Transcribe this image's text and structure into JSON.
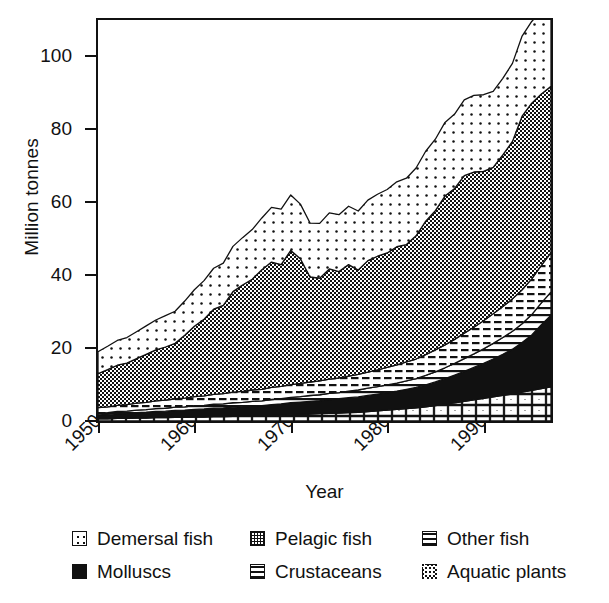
{
  "axes": {
    "ylabel": "Million tonnes",
    "xlabel": "Year",
    "yticks": [
      "0",
      "20",
      "40",
      "60",
      "80",
      "100"
    ],
    "xticks": [
      "1950",
      "1960",
      "1970",
      "1980",
      "1990"
    ]
  },
  "legend": {
    "items": [
      {
        "label": "Demersal fish",
        "swatch": "sparse-dots-swatch-icon"
      },
      {
        "label": "Pelagic fish",
        "swatch": "crosshatch-swatch-icon"
      },
      {
        "label": "Other fish",
        "swatch": "dashed-lines-swatch-icon"
      },
      {
        "label": "Molluscs",
        "swatch": "solid-black-swatch-icon"
      },
      {
        "label": "Crustaceans",
        "swatch": "horizontal-lines-swatch-icon"
      },
      {
        "label": "Aquatic plants",
        "swatch": "fine-grid-swatch-icon"
      }
    ]
  },
  "chart_data": {
    "type": "area",
    "stacked": true,
    "title": "",
    "xlabel": "Year",
    "ylabel": "Million tonnes",
    "xlim": [
      1950,
      1997
    ],
    "ylim": [
      0,
      110
    ],
    "yticks": [
      0,
      20,
      40,
      60,
      80,
      100
    ],
    "xticks": [
      1950,
      1960,
      1970,
      1980,
      1990
    ],
    "grid": false,
    "legend_position": "below",
    "colors": {
      "ink": "#111111",
      "background": "#ffffff"
    },
    "x": [
      1950,
      1951,
      1952,
      1953,
      1954,
      1955,
      1956,
      1957,
      1958,
      1959,
      1960,
      1961,
      1962,
      1963,
      1964,
      1965,
      1966,
      1967,
      1968,
      1969,
      1970,
      1971,
      1972,
      1973,
      1974,
      1975,
      1976,
      1977,
      1978,
      1979,
      1980,
      1981,
      1982,
      1983,
      1984,
      1985,
      1986,
      1987,
      1988,
      1989,
      1990,
      1991,
      1992,
      1993,
      1994,
      1995,
      1996,
      1997
    ],
    "series": [
      {
        "name": "Aquatic plants",
        "order": 1,
        "values": [
          0.6,
          0.6,
          0.7,
          0.7,
          0.8,
          0.8,
          0.9,
          0.9,
          1.0,
          1.0,
          1.1,
          1.1,
          1.2,
          1.2,
          1.3,
          1.3,
          1.4,
          1.4,
          1.5,
          1.6,
          1.7,
          1.8,
          1.9,
          2.0,
          2.1,
          2.2,
          2.3,
          2.4,
          2.6,
          2.8,
          3.0,
          3.2,
          3.4,
          3.6,
          3.9,
          4.2,
          4.6,
          5.0,
          5.4,
          5.8,
          6.2,
          6.6,
          7.0,
          7.4,
          7.9,
          8.4,
          8.9,
          9.4
        ]
      },
      {
        "name": "Molluscs",
        "order": 2,
        "values": [
          1.1,
          1.2,
          1.3,
          1.4,
          1.5,
          1.6,
          1.7,
          1.8,
          1.9,
          2.0,
          2.1,
          2.2,
          2.3,
          2.4,
          2.5,
          2.6,
          2.7,
          2.8,
          3.0,
          3.1,
          3.3,
          3.4,
          3.5,
          3.6,
          3.8,
          3.9,
          4.1,
          4.2,
          4.4,
          4.6,
          4.8,
          5.0,
          5.3,
          5.6,
          6.0,
          6.5,
          7.0,
          7.6,
          8.2,
          8.9,
          9.6,
          10.4,
          11.3,
          12.3,
          13.6,
          15.2,
          17.5,
          19.6
        ]
      },
      {
        "name": "Crustaceans",
        "order": 3,
        "values": [
          0.5,
          0.5,
          0.6,
          0.6,
          0.7,
          0.7,
          0.8,
          0.8,
          0.9,
          0.9,
          1.0,
          1.0,
          1.1,
          1.1,
          1.2,
          1.2,
          1.3,
          1.3,
          1.4,
          1.4,
          1.5,
          1.5,
          1.6,
          1.6,
          1.7,
          1.7,
          1.8,
          1.9,
          2.0,
          2.0,
          2.1,
          2.2,
          2.3,
          2.4,
          2.6,
          2.8,
          3.0,
          3.2,
          3.5,
          3.7,
          4.0,
          4.3,
          4.6,
          4.9,
          5.2,
          5.6,
          6.0,
          6.4
        ]
      },
      {
        "name": "Other fish",
        "order": 4,
        "values": [
          1.5,
          1.6,
          1.7,
          1.8,
          1.9,
          2.0,
          2.1,
          2.2,
          2.3,
          2.4,
          2.5,
          2.6,
          2.7,
          2.8,
          2.9,
          3.0,
          3.1,
          3.2,
          3.3,
          3.4,
          3.5,
          3.6,
          3.7,
          3.8,
          3.9,
          4.0,
          4.1,
          4.3,
          4.4,
          4.6,
          4.8,
          5.0,
          5.2,
          5.4,
          5.7,
          6.0,
          6.3,
          6.6,
          7.0,
          7.3,
          7.7,
          8.1,
          8.5,
          8.9,
          9.3,
          9.8,
          10.3,
          10.8
        ]
      },
      {
        "name": "Pelagic fish",
        "order": 5,
        "values": [
          9.3,
          10.2,
          11.0,
          11.4,
          12.2,
          13.2,
          14.0,
          14.6,
          15.2,
          17.2,
          19.3,
          21.0,
          23.4,
          24.2,
          27.6,
          29.2,
          30.4,
          32.8,
          34.4,
          33.4,
          36.8,
          34.2,
          28.8,
          28.2,
          30.2,
          29.2,
          30.6,
          28.6,
          30.6,
          31.2,
          31.4,
          32.4,
          32.2,
          33.8,
          36.6,
          38.2,
          40.8,
          41.4,
          43.2,
          42.6,
          41.0,
          40.2,
          41.6,
          43.2,
          47.6,
          48.2,
          47.0,
          45.6
        ]
      },
      {
        "name": "Demersal fish",
        "order": 6,
        "values": [
          6.0,
          6.4,
          6.8,
          7.0,
          7.4,
          7.8,
          8.2,
          8.6,
          8.8,
          9.4,
          10.0,
          10.6,
          11.2,
          11.6,
          12.4,
          13.0,
          13.6,
          14.2,
          15.0,
          15.2,
          15.2,
          15.0,
          14.8,
          15.0,
          15.4,
          15.6,
          16.0,
          16.2,
          16.6,
          17.0,
          17.4,
          17.8,
          18.2,
          18.6,
          19.2,
          19.6,
          20.2,
          20.4,
          20.8,
          21.0,
          21.0,
          20.8,
          21.0,
          21.4,
          22.0,
          22.4,
          22.8,
          22.4
        ]
      }
    ],
    "totals": [
      19.0,
      20.5,
      22.1,
      22.9,
      24.5,
      26.1,
      27.7,
      28.9,
      30.1,
      32.9,
      36.0,
      38.5,
      41.9,
      43.3,
      47.9,
      50.3,
      52.5,
      55.7,
      58.6,
      58.1,
      62.0,
      59.5,
      54.3,
      54.2,
      57.1,
      56.6,
      58.9,
      57.6,
      60.6,
      62.2,
      63.5,
      65.6,
      66.6,
      69.4,
      73.9,
      77.3,
      81.9,
      84.2,
      88.1,
      89.3,
      89.5,
      90.4,
      94.0,
      98.1,
      105.6,
      109.6,
      112.5,
      113.6
    ]
  }
}
